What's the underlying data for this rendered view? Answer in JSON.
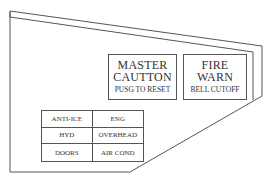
{
  "panel": {
    "line_color": "#555555",
    "master_caution": {
      "line1": "MASTER",
      "line2": "CAUTTON",
      "subtext": "PUSG TO RESET"
    },
    "fire_warn": {
      "line1": "FIRE",
      "line2": "WARN",
      "subtext": "BELL CUTOFF"
    },
    "annunciators": [
      {
        "label": "ANTI-ICE"
      },
      {
        "label": "ENG"
      },
      {
        "label": "HYD"
      },
      {
        "label": "OVERHEAD"
      },
      {
        "label": "DOORS"
      },
      {
        "label": "AIR COND"
      }
    ]
  }
}
